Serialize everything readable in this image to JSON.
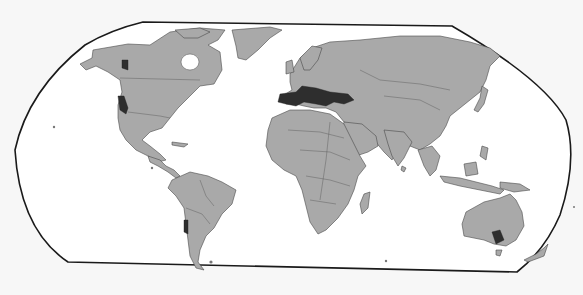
{
  "map": {
    "type": "world-map",
    "projection": "Robinson-like (flat top and bottom, curved sides)",
    "colors": {
      "background": "#f7f7f7",
      "ocean": "#ffffff",
      "land": "#a9a9a9",
      "highlight": "#2e2e2e",
      "frame": "#1a1a1a"
    },
    "legend": null,
    "highlighted_regions": [
      {
        "id": "california",
        "label": "California coast",
        "continent": "North America"
      },
      {
        "id": "pacific-northwest",
        "label": "Pacific Northwest coast",
        "continent": "North America"
      },
      {
        "id": "mediterranean-basin",
        "label": "Mediterranean Basin (Iberia, S. Europe, Turkey, Levant, N. Africa coast)",
        "continent": "Europe/Asia/Africa"
      },
      {
        "id": "central-chile",
        "label": "Central Chile",
        "continent": "South America"
      },
      {
        "id": "south-australia",
        "label": "South Australia / Victoria",
        "continent": "Oceania"
      }
    ]
  }
}
